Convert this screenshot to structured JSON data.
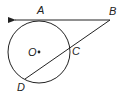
{
  "diagram": {
    "type": "circle-tangent-secant",
    "colors": {
      "stroke": "#222222",
      "background": "#ffffff"
    },
    "circle": {
      "center_label": "O",
      "cx": 39,
      "cy": 52,
      "r": 31
    },
    "points": {
      "A": {
        "label": "A",
        "x": 40,
        "y": 20,
        "label_x": 37,
        "label_y": 14
      },
      "B": {
        "label": "B",
        "x": 110,
        "y": 20,
        "label_x": 109,
        "label_y": 15
      },
      "C": {
        "label": "C",
        "x": 69,
        "y": 48,
        "label_x": 72,
        "label_y": 55
      },
      "D": {
        "label": "D",
        "x": 25,
        "y": 79,
        "label_x": 17,
        "label_y": 91
      },
      "O": {
        "label": "O",
        "x": 39,
        "y": 52,
        "label_x": 28,
        "label_y": 56
      }
    },
    "segments": [
      {
        "name": "tangent-ray-BA",
        "from": "B",
        "through": "A",
        "arrow": "left"
      },
      {
        "name": "secant-BD",
        "from": "B",
        "through": "C",
        "to": "D"
      }
    ]
  }
}
